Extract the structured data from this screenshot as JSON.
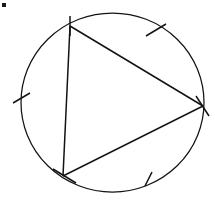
{
  "figure": {
    "description": "A circle containing an inscribed triangle whose three vertices lie on the circle. Each of the three arcs cut off by the triangle's sides carries a single tick mark, and each vertex is marked with a short tick stroke.",
    "background_color": "#ffffff",
    "ink_color": "#131313"
  },
  "geometry": {
    "canvas": {
      "width": 215,
      "height": 201
    },
    "circle": {
      "label": "circumscribed-circle",
      "center": {
        "x": 112.5,
        "y": 102.5
      },
      "radius_x": 91.5,
      "radius_y": 89.5,
      "stroke_width": 1.25
    },
    "triangle": {
      "label": "inscribed-triangle",
      "vertices": [
        {
          "name": "top-vertex",
          "x": 70,
          "y": 26
        },
        {
          "name": "right-vertex",
          "x": 203,
          "y": 106
        },
        {
          "name": "bottom-left-vertex",
          "x": 63,
          "y": 176
        }
      ],
      "sides": [
        {
          "name": "side-top-right",
          "from": "top-vertex",
          "to": "right-vertex"
        },
        {
          "name": "side-right-bottom",
          "from": "right-vertex",
          "to": "bottom-left-vertex"
        },
        {
          "name": "side-left",
          "from": "bottom-left-vertex",
          "to": "top-vertex"
        }
      ],
      "stroke_width": 1.5
    },
    "arc_tick_marks": [
      {
        "name": "arc-tick-upper-right",
        "x1": 146,
        "y1": 36,
        "x2": 166,
        "y2": 24
      },
      {
        "name": "arc-tick-lower-right",
        "x1": 145,
        "y1": 186,
        "x2": 152,
        "y2": 172
      },
      {
        "name": "arc-tick-left",
        "x1": 13,
        "y1": 103,
        "x2": 30,
        "y2": 93
      }
    ],
    "vertex_tick_marks": [
      {
        "name": "vertex-tick-top",
        "x1": 70,
        "y1": 16,
        "x2": 70,
        "y2": 36
      },
      {
        "name": "vertex-tick-right",
        "x1": 196,
        "y1": 96,
        "x2": 209,
        "y2": 116
      },
      {
        "name": "vertex-tick-bottom-left",
        "x1": 53,
        "y1": 169,
        "x2": 76,
        "y2": 183
      }
    ],
    "corner_mark": {
      "name": "corner-speck",
      "x": 2,
      "y": 3,
      "width": 4,
      "height": 4
    }
  }
}
